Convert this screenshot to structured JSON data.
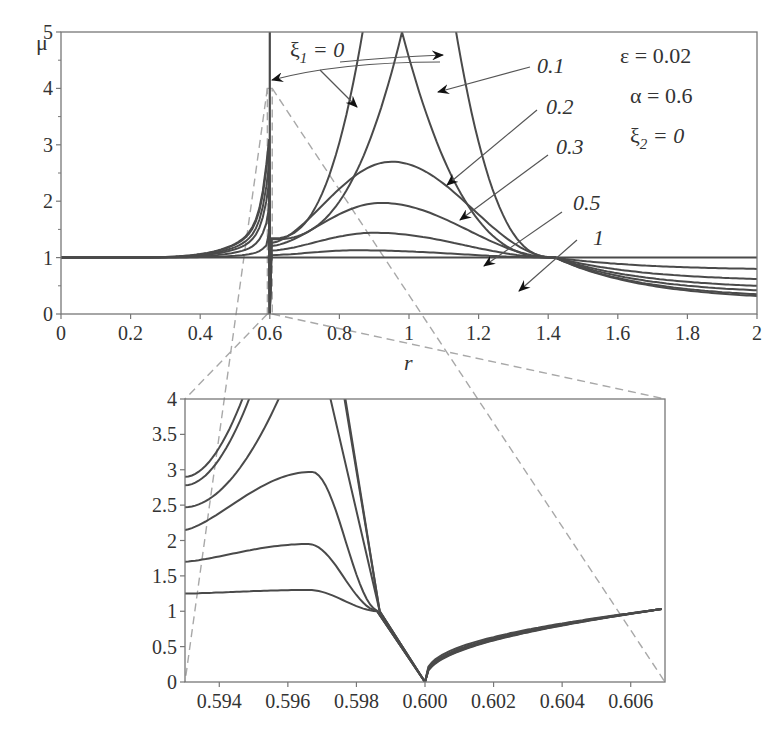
{
  "chart_data": [
    {
      "id": "main",
      "type": "line",
      "title": "",
      "xlabel": "r",
      "ylabel": "μ",
      "xlim": [
        0,
        2
      ],
      "ylim": [
        0,
        5
      ],
      "xticks": [
        0,
        0.2,
        0.4,
        0.6,
        0.8,
        1,
        1.2,
        1.4,
        1.6,
        1.8,
        2
      ],
      "xtick_labels": [
        "0",
        "0.2",
        "0.4",
        "0.6",
        "0.8",
        "1",
        "1.2",
        "1.4",
        "1.6",
        "1.8",
        "2"
      ],
      "yticks": [
        0,
        1,
        2,
        3,
        4,
        5
      ],
      "ytick_labels": [
        "0",
        "1",
        "2",
        "3",
        "4",
        "5"
      ],
      "grid": false,
      "parameters": [
        "ε = 0.02",
        "α = 0.6",
        "ξ₂ = 0"
      ],
      "series_label_prefix": "ξ₁",
      "series": [
        {
          "name": "ξ₁ = 0",
          "peak": [
            1.0,
            12.0
          ],
          "left_at_0_59": 2.9,
          "right_end": 0.32
        },
        {
          "name": "ξ₁ = 0.1",
          "peak": [
            0.98,
            5.0
          ],
          "left_at_0_59": 2.8,
          "right_end": 0.35
        },
        {
          "name": "ξ₁ = 0.2",
          "peak": [
            0.95,
            2.7
          ],
          "left_at_0_59": 2.45,
          "right_end": 0.42
        },
        {
          "name": "ξ₁ = 0.3",
          "peak": [
            0.92,
            1.97
          ],
          "left_at_0_59": 2.15,
          "right_end": 0.5
        },
        {
          "name": "ξ₁ = 0.5",
          "peak": [
            0.9,
            1.44
          ],
          "left_at_0_59": 1.7,
          "right_end": 0.62
        },
        {
          "name": "ξ₁ = 1",
          "peak": [
            0.85,
            1.13
          ],
          "left_at_0_59": 1.25,
          "right_end": 0.8
        }
      ],
      "flat_line": {
        "name": "μ = 1",
        "y": 1
      },
      "crossing_point": [
        1.42,
        1.0
      ],
      "singularity_x": 0.6,
      "annotations": [
        {
          "text": "ξ₁ = 0",
          "points_to": [
            0.6,
            4.1
          ]
        },
        {
          "text": "0.1"
        },
        {
          "text": "0.2"
        },
        {
          "text": "0.3"
        },
        {
          "text": "0.5"
        },
        {
          "text": "1"
        }
      ],
      "zoom_region": {
        "x": [
          0.593,
          0.607
        ],
        "y": [
          0,
          4
        ]
      }
    },
    {
      "id": "inset",
      "type": "line",
      "title": "",
      "xlabel": "",
      "ylabel": "",
      "xlim": [
        0.593,
        0.607
      ],
      "ylim": [
        0,
        4
      ],
      "xticks": [
        0.594,
        0.596,
        0.598,
        0.6,
        0.602,
        0.604,
        0.606
      ],
      "xtick_labels": [
        "0.594",
        "0.596",
        "0.598",
        "0.600",
        "0.602",
        "0.604",
        "0.606"
      ],
      "yticks": [
        0,
        0.5,
        1,
        1.5,
        2,
        2.5,
        3,
        3.5,
        4
      ],
      "ytick_labels": [
        "0",
        "0.5",
        "1",
        "1.5",
        "2",
        "2.5",
        "3",
        "3.5",
        "4"
      ],
      "grid": false,
      "series": [
        {
          "name": "ξ₁ = 0",
          "y_at_left": 2.9,
          "peak": null
        },
        {
          "name": "ξ₁ = 0.1",
          "y_at_left": 2.78,
          "peak": null
        },
        {
          "name": "ξ₁ = 0.2",
          "y_at_left": 2.47,
          "peak": null
        },
        {
          "name": "ξ₁ = 0.3",
          "y_at_left": 2.15,
          "peak": [
            0.5967,
            2.97
          ]
        },
        {
          "name": "ξ₁ = 0.5",
          "y_at_left": 1.7,
          "peak": [
            0.5966,
            1.95
          ]
        },
        {
          "name": "ξ₁ = 1",
          "y_at_left": 1.25,
          "peak": [
            0.5966,
            1.3
          ]
        }
      ],
      "common_point": [
        0.59868,
        1.0
      ],
      "minimum": [
        0.6,
        0.0
      ],
      "right_end": [
        0.6069,
        1.03
      ]
    }
  ],
  "labels": {
    "y_axis_title": "μ",
    "x_axis_title": "r",
    "param_eps": "ε = 0.02",
    "param_alpha": "α = 0.6",
    "param_xi2_sym": "ξ",
    "param_xi2_sub": "2",
    "param_xi2_val": " = 0",
    "annot_xi1_sym": "ξ",
    "annot_xi1_sub": "1",
    "annot_xi1_val": " = 0",
    "annot_01": "0.1",
    "annot_02": "0.2",
    "annot_03": "0.3",
    "annot_05": "0.5",
    "annot_1": "1"
  },
  "colors": {
    "curve": "#4a4a4a",
    "axis": "#777777",
    "dashed": "#a8a8a8",
    "text": "#333333"
  }
}
